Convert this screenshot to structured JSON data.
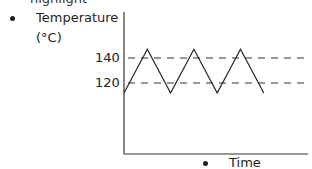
{
  "chart_data": {
    "type": "line",
    "title": "",
    "ylabel": "Temperature (°C)",
    "ylabel_lines": [
      "Temperature",
      "(°C)"
    ],
    "xlabel": "Time",
    "yticks": [
      120,
      140
    ],
    "ytick_labels": [
      "140",
      "120"
    ],
    "reference_lines": [
      {
        "value": 140,
        "style": "dashed"
      },
      {
        "value": 120,
        "style": "dashed"
      }
    ],
    "series": [
      {
        "name": "temperature",
        "x": [
          0,
          1,
          2,
          3,
          4,
          5,
          6
        ],
        "y": [
          112,
          147,
          112,
          147,
          112,
          147,
          112
        ]
      }
    ],
    "ylim": [
      70,
      150
    ],
    "xlim": [
      0,
      8
    ],
    "grid": false,
    "legend": "none"
  },
  "top_cut_text": "highlight"
}
